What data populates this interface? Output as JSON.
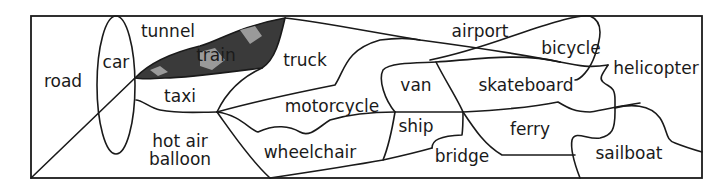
{
  "diagram": {
    "title": "",
    "colors": {
      "line": "#1a1a1a",
      "background": "#ffffff",
      "train_fill": "#3a3a3a"
    },
    "regions": [
      {
        "id": "road",
        "label": "road"
      },
      {
        "id": "car",
        "label": "car"
      },
      {
        "id": "tunnel",
        "label": "tunnel"
      },
      {
        "id": "train",
        "label": "train"
      },
      {
        "id": "taxi",
        "label": "taxi"
      },
      {
        "id": "hot-air-balloon",
        "label_line1": "hot air",
        "label_line2": "balloon"
      },
      {
        "id": "truck",
        "label": "truck"
      },
      {
        "id": "motorcycle",
        "label": "motorcycle"
      },
      {
        "id": "wheelchair",
        "label": "wheelchair"
      },
      {
        "id": "airport",
        "label": "airport"
      },
      {
        "id": "van",
        "label": "van"
      },
      {
        "id": "ship",
        "label": "ship"
      },
      {
        "id": "bridge",
        "label": "bridge"
      },
      {
        "id": "skateboard",
        "label": "skateboard"
      },
      {
        "id": "ferry",
        "label": "ferry"
      },
      {
        "id": "bicycle",
        "label": "bicycle"
      },
      {
        "id": "helicopter",
        "label": "helicopter"
      },
      {
        "id": "sailboat",
        "label": "sailboat"
      }
    ]
  }
}
